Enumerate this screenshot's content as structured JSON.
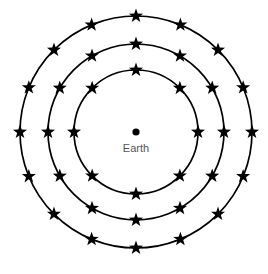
{
  "figure": {
    "background_color": "#ffffff",
    "stroke_color": "#000000",
    "label_color": "#555555",
    "width": 268,
    "height": 274
  },
  "center": {
    "label": "Earth",
    "dot_name": "earth-dot",
    "x": 136,
    "y": 132,
    "dot_radius": 3.6,
    "label_x": 136,
    "label_y": 149,
    "label_font_size": 11
  },
  "chart_data": {
    "type": "scatter",
    "xlabel": "",
    "ylabel": "",
    "center_label": "Earth",
    "coordinate_system": "polar",
    "grid": false,
    "legend": "none",
    "rings": [
      {
        "name": "inner-orbit",
        "radius": 62,
        "star_count": 8,
        "angle_step_deg": 45,
        "start_angle_deg": -90,
        "star_size": 7.4,
        "stroke_width": 1.7
      },
      {
        "name": "middle-orbit",
        "radius": 88,
        "star_count": 12,
        "angle_step_deg": 30,
        "start_angle_deg": -90,
        "star_size": 7.4,
        "stroke_width": 1.7
      },
      {
        "name": "outer-orbit",
        "radius": 116,
        "star_count": 16,
        "angle_step_deg": 22.5,
        "start_angle_deg": -90,
        "star_size": 7.4,
        "stroke_width": 1.7
      }
    ]
  }
}
